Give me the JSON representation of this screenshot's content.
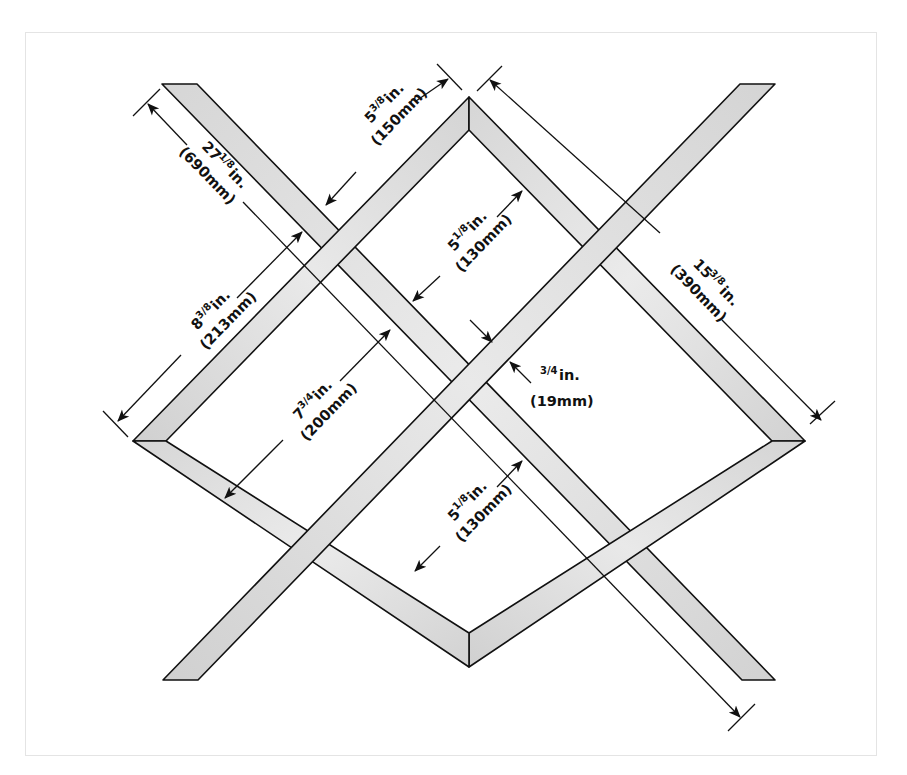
{
  "diagram": {
    "type": "woodworking-dimension-drawing",
    "colors": {
      "background": "#ffffff",
      "border": "#e4e4e4",
      "wood_fill": "#d9d9d9",
      "wood_highlight": "#ececec",
      "outline": "#111111",
      "dimension_line": "#111111"
    },
    "dimensions": [
      {
        "id": "slat-length",
        "whole": "27",
        "fraction": "1/8",
        "unit": "in.",
        "metric": "(690mm)"
      },
      {
        "id": "frame-top-side",
        "whole": "5",
        "fraction": "3/8",
        "unit": "in.",
        "metric": "(150mm)"
      },
      {
        "id": "frame-long-side",
        "whole": "15",
        "fraction": "3/8",
        "unit": "in.",
        "metric": "(390mm)"
      },
      {
        "id": "upper-opening",
        "whole": "5",
        "fraction": "1/8",
        "unit": "in.",
        "metric": "(130mm)"
      },
      {
        "id": "frame-left-side",
        "whole": "8",
        "fraction": "3/8",
        "unit": "in.",
        "metric": "(213mm)"
      },
      {
        "id": "left-opening",
        "whole": "7",
        "fraction": "3/4",
        "unit": "in.",
        "metric": "(200mm)"
      },
      {
        "id": "stock-thickness",
        "whole": "",
        "fraction": "3/4",
        "unit": "in.",
        "metric": "(19mm)"
      },
      {
        "id": "lower-opening",
        "whole": "5",
        "fraction": "1/8",
        "unit": "in.",
        "metric": "(130mm)"
      }
    ]
  }
}
